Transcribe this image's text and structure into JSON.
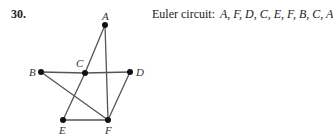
{
  "problem": {
    "number": "30.",
    "caption_label": "Euler circuit:",
    "caption_sequence": "A, F, D, C, E, F, B, C, A"
  },
  "graph": {
    "nodes": [
      {
        "id": "A",
        "x": 105,
        "y": 25,
        "lx": 102,
        "ly": 20
      },
      {
        "id": "B",
        "x": 41,
        "y": 72,
        "lx": 29,
        "ly": 76
      },
      {
        "id": "C",
        "x": 85,
        "y": 73,
        "lx": 76,
        "ly": 67
      },
      {
        "id": "D",
        "x": 130,
        "y": 72,
        "lx": 136,
        "ly": 76
      },
      {
        "id": "E",
        "x": 63,
        "y": 120,
        "lx": 59,
        "ly": 134
      },
      {
        "id": "F",
        "x": 108,
        "y": 120,
        "lx": 105,
        "ly": 134
      }
    ],
    "edges": [
      [
        "A",
        "C"
      ],
      [
        "A",
        "F"
      ],
      [
        "B",
        "C"
      ],
      [
        "C",
        "D"
      ],
      [
        "C",
        "E"
      ],
      [
        "B",
        "F"
      ],
      [
        "D",
        "F"
      ],
      [
        "E",
        "F"
      ]
    ]
  }
}
